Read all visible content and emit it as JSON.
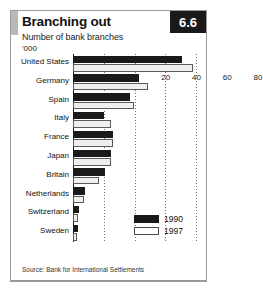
{
  "figure": {
    "badge": "6.6",
    "title": "Branching out",
    "subtitle": "Number of bank branches",
    "units": "'000",
    "source": "Source: Bank for International Settlements"
  },
  "chart_data": {
    "type": "bar",
    "orientation": "horizontal",
    "title": "Branching out",
    "subtitle": "Number of bank branches",
    "xlabel": "'000",
    "ylabel": "",
    "xlim": [
      0,
      80
    ],
    "xticks": [
      0,
      20,
      40,
      60,
      80
    ],
    "grid": true,
    "legend_position": "bottom-right",
    "categories": [
      "United States",
      "Germany",
      "Spain",
      "Italy",
      "France",
      "Japan",
      "Britain",
      "Netherlands",
      "Switzerland",
      "Sweden"
    ],
    "series": [
      {
        "name": "1990",
        "color": "#1a1a1a",
        "values": [
          71,
          43,
          37,
          20,
          26,
          25,
          21,
          8,
          4,
          3
        ]
      },
      {
        "name": "1997",
        "color": "#efefef",
        "values": [
          78,
          49,
          39.5,
          25,
          26,
          25,
          17,
          7,
          3,
          2.5
        ]
      }
    ]
  }
}
